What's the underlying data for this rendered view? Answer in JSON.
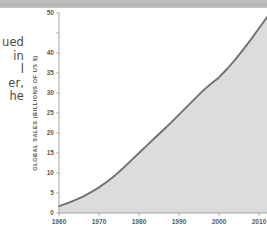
{
  "top_band": {
    "color": "#b6b6b6"
  },
  "body_text": {
    "lines": [
      "ued",
      "in",
      "l",
      "er,",
      "he"
    ]
  },
  "chart_data": {
    "type": "area",
    "title": "",
    "subtitle": "",
    "xlabel": "",
    "ylabel": "GLOBAL SALES (BILLIONS OF US $)",
    "grid": false,
    "legend": "none",
    "line_color": "#707070",
    "fill_color": "#dcdcdc",
    "axis_color": "#9a9a9a",
    "xlim": [
      1960,
      2012
    ],
    "ylim": [
      0,
      50
    ],
    "xticks": [
      1960,
      1970,
      1980,
      1990,
      2000,
      2010
    ],
    "xtick_labels": [
      "1960",
      "1970",
      "1980",
      "1990",
      "2000",
      "2010"
    ],
    "yticks": [
      0,
      5,
      10,
      15,
      20,
      25,
      30,
      35,
      40,
      45,
      50
    ],
    "ytick_labels": [
      "0",
      "5",
      "10",
      "15",
      "20",
      "25",
      "30",
      "35",
      "40",
      "",
      "50"
    ],
    "x": [
      1960,
      1962,
      1964,
      1966,
      1968,
      1970,
      1972,
      1974,
      1976,
      1978,
      1980,
      1982,
      1984,
      1986,
      1988,
      1990,
      1992,
      1994,
      1996,
      1998,
      2000,
      2002,
      2004,
      2006,
      2008,
      2010,
      2012
    ],
    "values": [
      1.7,
      2.4,
      3.2,
      4.1,
      5.2,
      6.4,
      7.8,
      9.4,
      11.2,
      13.1,
      15.0,
      16.9,
      18.8,
      20.7,
      22.6,
      24.6,
      26.6,
      28.6,
      30.6,
      32.3,
      33.9,
      36.0,
      38.3,
      40.8,
      43.4,
      46.2,
      49.0
    ]
  }
}
